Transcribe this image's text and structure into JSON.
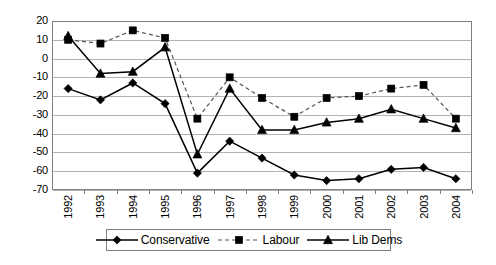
{
  "chart_data": {
    "type": "line",
    "title": "",
    "subtitle": "",
    "xlabel": "",
    "ylabel": "",
    "categories": [
      "1992",
      "1993",
      "1994",
      "1995",
      "1996",
      "1997",
      "1998",
      "1999",
      "2000",
      "2001",
      "2002",
      "2003",
      "2004"
    ],
    "series": [
      {
        "name": "Conservative",
        "marker": "diamond",
        "linestyle": "solid",
        "color": "#000000",
        "values": [
          -16,
          -22,
          -13,
          -24,
          -61,
          -44,
          -53,
          -62,
          -65,
          -64,
          -59,
          -58,
          -64
        ]
      },
      {
        "name": "Labour",
        "marker": "square",
        "linestyle": "dashed",
        "color": "#000000",
        "values": [
          10,
          8,
          15,
          11,
          -32,
          -10,
          -21,
          -31,
          -21,
          -20,
          -16,
          -14,
          -32
        ]
      },
      {
        "name": "Lib Dems",
        "marker": "triangle",
        "linestyle": "solid",
        "color": "#000000",
        "values": [
          12,
          -8,
          -7,
          6,
          -51,
          -16,
          -38,
          -38,
          -34,
          -32,
          -27,
          -32,
          -37
        ]
      }
    ],
    "ylim": [
      -70,
      20
    ],
    "yticks": [
      20,
      10,
      0,
      -10,
      -20,
      -30,
      -40,
      -50,
      -60,
      -70
    ],
    "ytick_labels": [
      "20",
      "10",
      "0",
      "-10",
      "-20",
      "-30",
      "-40",
      "-50",
      "-60",
      "-70"
    ],
    "grid": true,
    "grid_axis": "y",
    "legend_position": "bottom",
    "legend_entries": [
      "Conservative",
      "Labour",
      "Lib Dems"
    ]
  }
}
